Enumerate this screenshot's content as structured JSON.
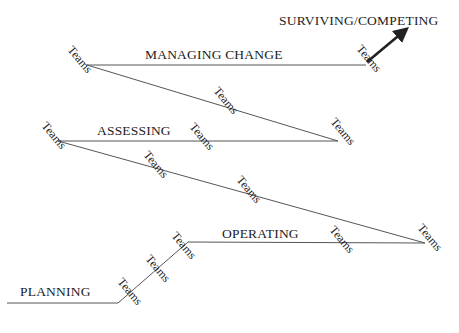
{
  "diagram": {
    "stages": [
      {
        "id": "planning",
        "label": "PLANNING"
      },
      {
        "id": "operating",
        "label": "OPERATING"
      },
      {
        "id": "assessing",
        "label": "ASSESSING"
      },
      {
        "id": "managing_change",
        "label": "MANAGING CHANGE"
      },
      {
        "id": "surviving",
        "label": "SURVIVING/COMPETING"
      }
    ],
    "team_label": "Teams",
    "teams": [
      {
        "label": "Teams"
      },
      {
        "label": "Teams"
      },
      {
        "label": "Teams"
      },
      {
        "label": "Teams"
      },
      {
        "label": "Teams"
      },
      {
        "label": "Teams"
      },
      {
        "label": "Teams"
      },
      {
        "label": "Teams"
      },
      {
        "label": "Teams"
      },
      {
        "label": "Teams"
      },
      {
        "label": "Teams"
      },
      {
        "label": "Teams"
      },
      {
        "label": "Teams"
      }
    ],
    "colors": {
      "line": "#555555",
      "text": "#222222",
      "arrow": "#222222",
      "background": "#ffffff"
    }
  }
}
